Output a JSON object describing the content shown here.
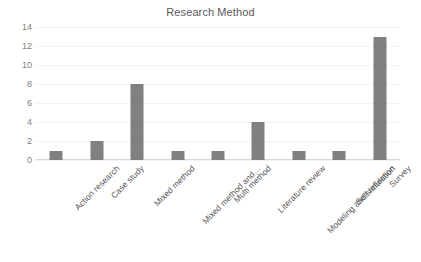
{
  "chart_data": {
    "type": "bar",
    "title": "Research Method",
    "xlabel": "",
    "ylabel": "",
    "categories": [
      "Action research",
      "Case study",
      "Mixed method",
      "Mixed method  and…",
      "Multi method",
      "Literature review",
      "Modeling and simulation",
      "Self reflection",
      "Survey"
    ],
    "values": [
      1,
      2,
      8,
      1,
      1,
      4,
      1,
      1,
      13
    ],
    "ylim": [
      0,
      14
    ],
    "ytick_labels": [
      "14",
      "12",
      "10",
      "8",
      "6",
      "4",
      "2",
      "0"
    ],
    "ytick_values": [
      14,
      12,
      10,
      8,
      6,
      4,
      2,
      0
    ],
    "ytick_step": 2,
    "grid": true,
    "legend": false,
    "legend_position": "none",
    "bar_color": "#808080",
    "gridline_color": "#f2f2f2",
    "axis_color": "#d9d9d9",
    "text_color": "#595959",
    "tick_text_color": "#808080",
    "background_color": "#ffffff",
    "label_rotation": -45
  }
}
